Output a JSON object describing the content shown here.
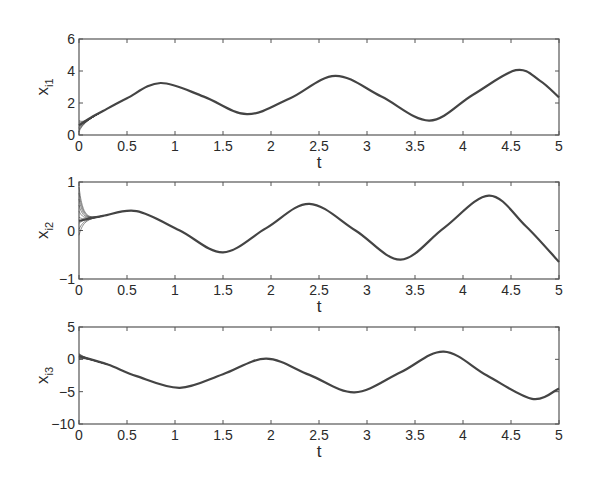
{
  "chart_data": [
    {
      "type": "line",
      "title": "",
      "xlabel": "t",
      "ylabel": "x_i1",
      "ylabel_main": "x",
      "ylabel_sub": "i1",
      "xlim": [
        0,
        5
      ],
      "ylim": [
        0,
        6
      ],
      "xticks": [
        "0",
        "0.5",
        "1",
        "1.5",
        "2",
        "2.5",
        "3",
        "3.5",
        "4",
        "4.5",
        "5"
      ],
      "yticks": [
        "0",
        "2",
        "4",
        "6"
      ],
      "ytick_values": [
        0,
        2,
        4,
        6
      ],
      "grid": false,
      "legend": null,
      "series": [
        {
          "name": "x_i1 (multiple agents, converged)",
          "x": [
            0,
            0.1,
            0.25,
            0.5,
            0.85,
            1.3,
            1.75,
            2.2,
            2.67,
            3.15,
            3.65,
            4.1,
            4.55,
            4.8,
            5
          ],
          "values": [
            0.6,
            1.0,
            1.5,
            2.3,
            3.25,
            2.4,
            1.3,
            2.3,
            3.7,
            2.4,
            0.9,
            2.5,
            4.05,
            3.4,
            2.35
          ]
        }
      ],
      "transient": {
        "t_end": 0.25,
        "spread_at_t0": [
          0.2,
          0.9
        ]
      }
    },
    {
      "type": "line",
      "title": "",
      "xlabel": "t",
      "ylabel": "x_i2",
      "ylabel_main": "x",
      "ylabel_sub": "i2",
      "xlim": [
        0,
        5
      ],
      "ylim": [
        -1,
        1
      ],
      "xticks": [
        "0",
        "0.5",
        "1",
        "1.5",
        "2",
        "2.5",
        "3",
        "3.5",
        "4",
        "4.5",
        "5"
      ],
      "yticks": [
        "-1",
        "0",
        "1"
      ],
      "ytick_values": [
        -1,
        0,
        1
      ],
      "grid": false,
      "legend": null,
      "series": [
        {
          "name": "x_i2 (multiple agents, converged)",
          "x": [
            0,
            0.25,
            0.6,
            1.05,
            1.5,
            1.95,
            2.4,
            2.88,
            3.35,
            3.8,
            4.27,
            4.65,
            5
          ],
          "values": [
            0.2,
            0.3,
            0.4,
            0.0,
            -0.45,
            0.05,
            0.55,
            0.0,
            -0.6,
            0.05,
            0.72,
            0.1,
            -0.65
          ]
        }
      ],
      "transient": {
        "t_end": 0.25,
        "spread_at_t0": [
          -0.1,
          0.9
        ]
      }
    },
    {
      "type": "line",
      "title": "",
      "xlabel": "t",
      "ylabel": "x_i3",
      "ylabel_main": "x",
      "ylabel_sub": "i3",
      "xlim": [
        0,
        5
      ],
      "ylim": [
        -10,
        5
      ],
      "xticks": [
        "0",
        "0.5",
        "1",
        "1.5",
        "2",
        "2.5",
        "3",
        "3.5",
        "4",
        "4.5",
        "5"
      ],
      "yticks": [
        "-10",
        "-5",
        "0",
        "5"
      ],
      "ytick_values": [
        -10,
        -5,
        0,
        5
      ],
      "grid": false,
      "legend": null,
      "series": [
        {
          "name": "x_i3 (multiple agents, converged)",
          "x": [
            0,
            0.3,
            0.6,
            1.05,
            1.5,
            1.95,
            2.4,
            2.87,
            3.35,
            3.8,
            4.25,
            4.72,
            5
          ],
          "values": [
            0.5,
            -0.8,
            -2.6,
            -4.4,
            -2.3,
            0.1,
            -2.4,
            -5.1,
            -2.0,
            1.2,
            -2.5,
            -6.1,
            -4.5
          ]
        }
      ],
      "transient": {
        "t_end": 0.3,
        "spread_at_t0": [
          0.0,
          0.9
        ]
      }
    }
  ]
}
